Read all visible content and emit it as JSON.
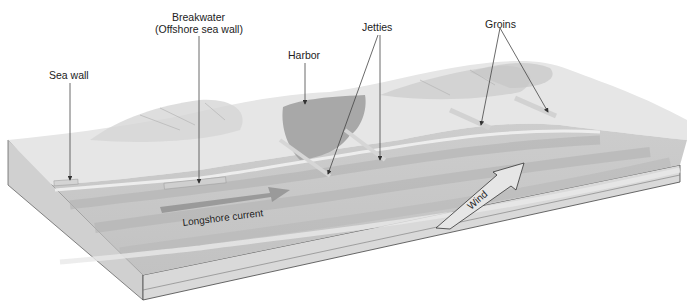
{
  "diagram": {
    "type": "block-diagram",
    "labels": {
      "sea_wall": "Sea wall",
      "breakwater_line1": "Breakwater",
      "breakwater_line2": "(Offshore sea wall)",
      "harbor": "Harbor",
      "jetties": "Jetties",
      "groins": "Groins",
      "longshore_current": "Longshore current",
      "wind": "Wind"
    },
    "colors": {
      "background": "#ffffff",
      "land": "#e4e4e4",
      "land_relief": "#cfcfcf",
      "water": "#c8c8c8",
      "water_dark": "#b4b4b4",
      "harbor": "#a9a9a9",
      "block_side": "#d2d2d2",
      "block_front": "#dcdcdc",
      "outline": "#444444",
      "arrow_fill": "#e6e6e6",
      "current_arrow": "#8f8f8f",
      "text": "#222222"
    }
  }
}
